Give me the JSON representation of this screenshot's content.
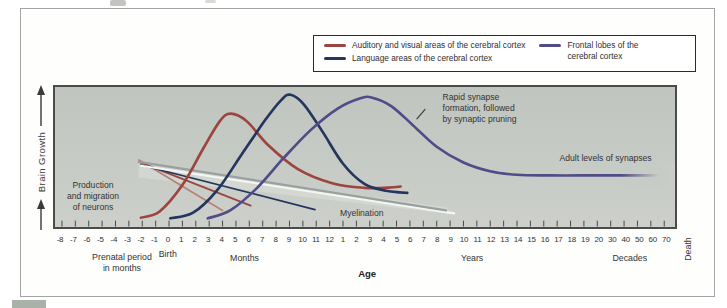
{
  "chart_data": {
    "type": "line",
    "y_axis": {
      "label": "Brain Growth"
    },
    "x_axis": {
      "label": "Age",
      "tick_labels": [
        "-8",
        "-7",
        "-6",
        "-5",
        "-4",
        "-3",
        "-2",
        "-1",
        "0",
        "1",
        "2",
        "3",
        "4",
        "5",
        "6",
        "7",
        "8",
        "9",
        "10",
        "11",
        "12",
        "1",
        "2",
        "3",
        "4",
        "5",
        "6",
        "7",
        "8",
        "9",
        "10",
        "11",
        "12",
        "13",
        "14",
        "15",
        "16",
        "17",
        "18",
        "19",
        "20",
        "30",
        "40",
        "50",
        "60",
        "70"
      ],
      "sub_labels": {
        "birth": {
          "text": "Birth",
          "tick": 8.0,
          "y": 249
        },
        "prenatal": {
          "text": "Prenatal period\nin months",
          "tick": 4.6,
          "y": 252
        },
        "months": {
          "text": "Months",
          "tick": 13.7,
          "y": 253
        },
        "age": {
          "text": "Age",
          "tick": 22.8,
          "y": 268,
          "bold": true
        },
        "years": {
          "text": "Years",
          "tick": 30.6,
          "y": 253
        },
        "decades": {
          "text": "Decades",
          "tick": 42.3,
          "y": 253
        },
        "death": {
          "text": "Death",
          "x": 689,
          "y": 249,
          "rotated": true
        }
      }
    },
    "legend": {
      "columns": [
        {
          "items": [
            {
              "label": "Auditory and visual areas of the cerebral cortex",
              "color": "#9c4540"
            },
            {
              "label": "Language areas of the cerebral cortex",
              "color": "#24365e"
            }
          ]
        },
        {
          "items": [
            {
              "label": "Frontal lobes of the\ncerebral cortex",
              "color": "#514c87"
            }
          ]
        }
      ]
    },
    "series": [
      {
        "name": "Auditory and visual areas of the cerebral cortex",
        "color": "#9c4540",
        "points": [
          [
            5.9,
            0.02
          ],
          [
            7.3,
            0.07
          ],
          [
            9.0,
            0.28
          ],
          [
            10.6,
            0.58
          ],
          [
            11.8,
            0.79
          ],
          [
            12.6,
            0.85
          ],
          [
            13.8,
            0.79
          ],
          [
            15.4,
            0.6
          ],
          [
            17.6,
            0.41
          ],
          [
            20.2,
            0.295
          ],
          [
            22.6,
            0.258
          ],
          [
            24.4,
            0.26
          ],
          [
            25.3,
            0.268
          ]
        ]
      },
      {
        "name": "Language areas of the cerebral cortex",
        "color": "#24365e",
        "points": [
          [
            8.1,
            0.015
          ],
          [
            9.8,
            0.06
          ],
          [
            11.6,
            0.24
          ],
          [
            13.4,
            0.52
          ],
          [
            15.2,
            0.8
          ],
          [
            16.4,
            0.96
          ],
          [
            17.1,
            1.0
          ],
          [
            18.1,
            0.92
          ],
          [
            19.5,
            0.7
          ],
          [
            21.0,
            0.45
          ],
          [
            22.6,
            0.29
          ],
          [
            24.2,
            0.235
          ],
          [
            25.3,
            0.222
          ],
          [
            25.8,
            0.218
          ]
        ]
      },
      {
        "name": "Frontal lobes of the cerebral cortex",
        "color": "#514c87",
        "fades_out_right": true,
        "points": [
          [
            10.9,
            0.015
          ],
          [
            12.6,
            0.08
          ],
          [
            14.6,
            0.26
          ],
          [
            16.6,
            0.5
          ],
          [
            18.6,
            0.72
          ],
          [
            20.6,
            0.89
          ],
          [
            22.3,
            0.972
          ],
          [
            23.2,
            0.977
          ],
          [
            24.6,
            0.91
          ],
          [
            26.2,
            0.76
          ],
          [
            28.0,
            0.585
          ],
          [
            30.0,
            0.46
          ],
          [
            32.0,
            0.39
          ],
          [
            34.0,
            0.362
          ],
          [
            36.5,
            0.357
          ],
          [
            40.0,
            0.357
          ],
          [
            44.6,
            0.357
          ]
        ]
      }
    ],
    "aux_lines": [
      {
        "name": "neuron-migration-line-1",
        "color": "#b4837b",
        "width": 1.8,
        "from": [
          5.75,
          0.48
        ],
        "to": [
          12.0,
          0.078
        ]
      },
      {
        "name": "neuron-migration-line-2",
        "color": "#9c4540",
        "width": 1.8,
        "from": [
          5.75,
          0.465
        ],
        "to": [
          14.1,
          0.116
        ]
      },
      {
        "name": "neuron-migration-line-3",
        "color": "#24365e",
        "width": 1.8,
        "from": [
          5.9,
          0.44
        ],
        "to": [
          18.9,
          0.085
        ]
      },
      {
        "name": "myelination-highlight",
        "color": "#f4f6f1",
        "width": 2.2,
        "from": [
          5.9,
          0.434
        ],
        "to": [
          29.3,
          0.054
        ]
      },
      {
        "name": "myelination-line",
        "color": "#9aa0a2",
        "width": 2.3,
        "from": [
          5.75,
          0.465
        ],
        "to": [
          28.7,
          0.0775
        ]
      }
    ],
    "annotations": {
      "production": {
        "text": "Production\nand migration\nof neurons",
        "t": 2.45,
        "v": 0.2,
        "align": "center"
      },
      "rapid": {
        "text": "Rapid synapse\nformation, followed\nby synaptic pruning",
        "t": 28.4,
        "v": 0.884,
        "align": "left"
      },
      "adult": {
        "text": "Adult levels of synapses",
        "t": 40.5,
        "v": 0.496,
        "align": "center"
      },
      "myelination": {
        "text": "Myelination",
        "t": 22.4,
        "v": 0.07,
        "align": "center"
      }
    },
    "pointer_line": {
      "from": [
        26.5,
        0.806
      ],
      "to": [
        27.15,
        0.885
      ]
    }
  },
  "style": {
    "plot_background": "#c7cbc5",
    "plot_border": "#4b4b4b",
    "frame_border": "#a3a3a3",
    "legend_border": "#2b2b2b",
    "text_color": "#333333"
  }
}
